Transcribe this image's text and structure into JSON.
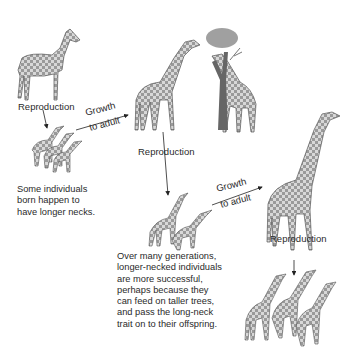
{
  "diagram": {
    "type": "process-flow",
    "topic": "Natural selection of giraffe neck length",
    "labels": {
      "reproduction_1": "Reproduction",
      "growth_1_line1": "Growth",
      "growth_1_line2": "to adult",
      "reproduction_2": "Reproduction",
      "growth_2_line1": "Growth",
      "growth_2_line2": "to adult",
      "reproduction_3": "Reproduction"
    },
    "captions": {
      "individuals": [
        "Some individuals",
        "born happen to",
        "have longer necks."
      ],
      "generations": [
        "Over many generations,",
        "longer-necked individuals",
        "are more successful,",
        "perhaps because they",
        "can feed on taller trees,",
        "and pass the long-neck",
        "trait on to their offspring."
      ]
    },
    "figures": [
      {
        "name": "ancestor-giraffe-icon",
        "description": "short-necked ancestor"
      },
      {
        "name": "offspring-group-1-icon",
        "description": "three young with varied neck lengths"
      },
      {
        "name": "adult-giraffes-feeding-icon",
        "description": "two adults feeding on tree"
      },
      {
        "name": "tree-icon",
        "description": "acacia tree"
      },
      {
        "name": "offspring-group-2-icon",
        "description": "two young long-necked"
      },
      {
        "name": "long-neck-adult-icon",
        "description": "tall adult giraffe"
      },
      {
        "name": "offspring-group-3-icon",
        "description": "three long-necked giraffes"
      }
    ]
  }
}
